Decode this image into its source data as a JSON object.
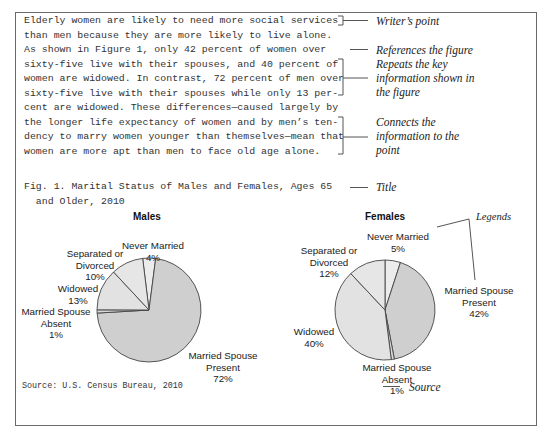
{
  "paragraph": {
    "lines": [
      "Elderly women are likely to need more social services",
      "than men because they are more likely to live alone.",
      "As shown in Figure 1, only 42 percent of women over",
      "sixty-five live with their spouses, and 40 percent of",
      "women are widowed. In contrast, 72 percent of men over",
      "sixty-five live with their spouses while only 13 per-",
      "cent are widowed. These differences—caused largely by",
      "the longer life expectancy of women and by men’s ten-",
      "dency to marry women younger than themselves—mean that",
      "women are more apt than men to face old age alone."
    ]
  },
  "annotations": {
    "writers_point": "Writer’s point",
    "references_figure": "References the figure",
    "repeats": [
      "Repeats the key",
      "information shown in",
      "the figure"
    ],
    "connects": [
      "Connects the",
      "information to the",
      "point"
    ],
    "title": "Title",
    "legends": "Legends",
    "source": "Source"
  },
  "figure": {
    "title_line1": "Fig. 1. Marital Status of Males and Females, Ages 65",
    "title_line2": "  and Older, 2010",
    "source": "Source: U.S. Census Bureau, 2010"
  },
  "chart_data": [
    {
      "type": "pie",
      "title": "Males",
      "categories": [
        "Never Married",
        "Married Spouse Present",
        "Married Spouse Absent",
        "Widowed",
        "Separated or Divorced"
      ],
      "values": [
        4,
        72,
        1,
        13,
        10
      ],
      "unit": "%",
      "colors": [
        "#ececec",
        "#cfcfcf",
        "#d8d8d8",
        "#e2e2e2",
        "#e6e6e6"
      ],
      "labels": {
        "never_married": [
          "Never Married",
          "4%"
        ],
        "married_present": [
          "Married Spouse",
          "Present",
          "72%"
        ],
        "married_absent": [
          "Married Spouse",
          "Absent",
          "1%"
        ],
        "widowed": [
          "Widowed",
          "13%"
        ],
        "separated": [
          "Separated or",
          "Divorced",
          "10%"
        ]
      }
    },
    {
      "type": "pie",
      "title": "Females",
      "categories": [
        "Never Married",
        "Married Spouse Present",
        "Married Spouse Absent",
        "Widowed",
        "Separated or Divorced"
      ],
      "values": [
        5,
        42,
        1,
        40,
        12
      ],
      "unit": "%",
      "colors": [
        "#ececec",
        "#cfcfcf",
        "#d8d8d8",
        "#e2e2e2",
        "#e6e6e6"
      ],
      "labels": {
        "never_married": [
          "Never Married",
          "5%"
        ],
        "married_present": [
          "Married Spouse",
          "Present",
          "42%"
        ],
        "married_absent": [
          "Married Spouse",
          "Absent",
          "1%"
        ],
        "widowed": [
          "Widowed",
          "40%"
        ],
        "separated": [
          "Separated or",
          "Divorced",
          "12%"
        ]
      }
    }
  ]
}
